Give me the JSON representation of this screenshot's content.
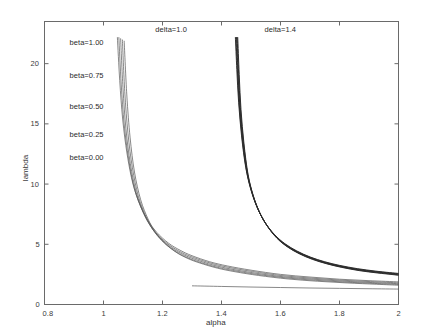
{
  "chart_data": {
    "type": "line",
    "title": "",
    "xlabel": "alpha",
    "ylabel": "lambda",
    "xlim": [
      0.8,
      2.0
    ],
    "ylim": [
      0,
      23.5
    ],
    "xticks": [
      "0.8",
      "1",
      "1.2",
      "1.4",
      "1.6",
      "1.8",
      "2"
    ],
    "xtick_values": [
      0.8,
      1.0,
      1.2,
      1.4,
      1.6,
      1.8,
      2.0
    ],
    "yticks": [
      "0",
      "5",
      "10",
      "15",
      "20"
    ],
    "ytick_values": [
      0,
      5,
      10,
      15,
      20
    ],
    "grid": false,
    "legend_position": "inside-upper-left",
    "annotations": [
      {
        "text": "delta=1.0",
        "x": 1.23,
        "y": 22.8
      },
      {
        "text": "delta=1.4",
        "x": 1.6,
        "y": 22.8
      }
    ],
    "legend_entries": [
      {
        "label": "beta=1.00",
        "y": 21.7
      },
      {
        "label": "beta=0.75",
        "y": 19.0
      },
      {
        "label": "beta=0.50",
        "y": 16.4
      },
      {
        "label": "beta=0.25",
        "y": 14.1
      },
      {
        "label": "beta=0.00",
        "y": 12.2
      }
    ],
    "series": [
      {
        "name": "delta=1.0, beta=1.00",
        "delta": 1.0,
        "beta": 1.0,
        "color": "#555555",
        "x": [
          1.047,
          1.055,
          1.065,
          1.08,
          1.1,
          1.125,
          1.15,
          1.18,
          1.22,
          1.26,
          1.3,
          1.36,
          1.42,
          1.5,
          1.6,
          1.7,
          1.8,
          1.9,
          2.0
        ],
        "y": [
          22.2,
          18.6,
          15.4,
          12.5,
          10.0,
          8.2,
          7.0,
          6.0,
          5.1,
          4.5,
          4.05,
          3.55,
          3.2,
          2.85,
          2.5,
          2.28,
          2.1,
          1.98,
          1.88
        ]
      },
      {
        "name": "delta=1.0, beta=0.75",
        "delta": 1.0,
        "beta": 0.75,
        "color": "#555555",
        "x": [
          1.052,
          1.06,
          1.07,
          1.085,
          1.105,
          1.13,
          1.155,
          1.185,
          1.225,
          1.265,
          1.305,
          1.365,
          1.425,
          1.505,
          1.605,
          1.705,
          1.805,
          1.905,
          2.0
        ],
        "y": [
          22.2,
          18.3,
          15.0,
          12.1,
          9.6,
          7.9,
          6.7,
          5.75,
          4.9,
          4.32,
          3.9,
          3.42,
          3.08,
          2.74,
          2.4,
          2.19,
          2.02,
          1.9,
          1.8
        ]
      },
      {
        "name": "delta=1.0, beta=0.50",
        "delta": 1.0,
        "beta": 0.5,
        "color": "#555555",
        "x": [
          1.058,
          1.066,
          1.076,
          1.091,
          1.111,
          1.136,
          1.161,
          1.191,
          1.231,
          1.271,
          1.311,
          1.371,
          1.431,
          1.511,
          1.611,
          1.711,
          1.811,
          1.911,
          2.0
        ],
        "y": [
          22.1,
          18.0,
          14.6,
          11.7,
          9.3,
          7.6,
          6.45,
          5.52,
          4.7,
          4.14,
          3.74,
          3.28,
          2.95,
          2.62,
          2.3,
          2.1,
          1.94,
          1.82,
          1.73
        ]
      },
      {
        "name": "delta=1.0, beta=0.25",
        "delta": 1.0,
        "beta": 0.25,
        "color": "#555555",
        "x": [
          1.064,
          1.072,
          1.083,
          1.098,
          1.118,
          1.143,
          1.168,
          1.198,
          1.238,
          1.278,
          1.318,
          1.378,
          1.438,
          1.518,
          1.618,
          1.718,
          1.818,
          1.918,
          2.0
        ],
        "y": [
          22.0,
          17.7,
          14.2,
          11.35,
          9.0,
          7.35,
          6.2,
          5.3,
          4.5,
          3.96,
          3.58,
          3.14,
          2.83,
          2.51,
          2.21,
          2.01,
          1.86,
          1.75,
          1.66
        ]
      },
      {
        "name": "delta=1.0, beta=0.00",
        "delta": 1.0,
        "beta": 0.0,
        "color": "#555555",
        "x": [
          1.07,
          1.079,
          1.09,
          1.105,
          1.126,
          1.151,
          1.176,
          1.206,
          1.246,
          1.286,
          1.326,
          1.386,
          1.446,
          1.526,
          1.626,
          1.726,
          1.826,
          1.926,
          2.0
        ],
        "y": [
          21.9,
          17.4,
          13.9,
          11.0,
          8.7,
          7.1,
          6.0,
          5.12,
          4.34,
          3.82,
          3.45,
          3.02,
          2.72,
          2.41,
          2.12,
          1.93,
          1.79,
          1.68,
          1.6
        ]
      },
      {
        "name": "delta=1.4, beta=1.00",
        "delta": 1.4,
        "beta": 1.0,
        "color": "#2a2a2a",
        "x": [
          1.447,
          1.452,
          1.458,
          1.468,
          1.482,
          1.5,
          1.522,
          1.548,
          1.58,
          1.615,
          1.655,
          1.7,
          1.75,
          1.8,
          1.86,
          1.92,
          1.97,
          2.0
        ],
        "y": [
          22.2,
          19.5,
          16.8,
          14.0,
          11.4,
          9.5,
          8.0,
          6.8,
          5.8,
          5.05,
          4.45,
          3.95,
          3.55,
          3.25,
          2.98,
          2.78,
          2.65,
          2.58
        ]
      },
      {
        "name": "delta=1.4, beta=0.75",
        "delta": 1.4,
        "beta": 0.75,
        "color": "#2a2a2a",
        "x": [
          1.449,
          1.454,
          1.46,
          1.47,
          1.484,
          1.502,
          1.524,
          1.55,
          1.582,
          1.617,
          1.657,
          1.702,
          1.752,
          1.802,
          1.862,
          1.922,
          1.972,
          2.0
        ],
        "y": [
          22.2,
          19.4,
          16.65,
          13.85,
          11.25,
          9.38,
          7.9,
          6.72,
          5.72,
          4.98,
          4.39,
          3.9,
          3.5,
          3.2,
          2.93,
          2.74,
          2.61,
          2.54
        ]
      },
      {
        "name": "delta=1.4, beta=0.50",
        "delta": 1.4,
        "beta": 0.5,
        "color": "#2a2a2a",
        "x": [
          1.451,
          1.456,
          1.462,
          1.472,
          1.486,
          1.504,
          1.526,
          1.552,
          1.584,
          1.619,
          1.659,
          1.704,
          1.754,
          1.804,
          1.864,
          1.924,
          1.974,
          2.0
        ],
        "y": [
          22.2,
          19.3,
          16.5,
          13.7,
          11.1,
          9.26,
          7.8,
          6.64,
          5.64,
          4.91,
          4.33,
          3.85,
          3.45,
          3.16,
          2.89,
          2.7,
          2.57,
          2.5
        ]
      },
      {
        "name": "delta=1.4, beta=0.25",
        "delta": 1.4,
        "beta": 0.25,
        "color": "#2a2a2a",
        "x": [
          1.453,
          1.458,
          1.464,
          1.474,
          1.488,
          1.506,
          1.528,
          1.554,
          1.586,
          1.621,
          1.661,
          1.706,
          1.756,
          1.806,
          1.866,
          1.926,
          1.976,
          2.0
        ],
        "y": [
          22.2,
          19.2,
          16.35,
          13.55,
          10.95,
          9.14,
          7.7,
          6.56,
          5.57,
          4.85,
          4.27,
          3.8,
          3.41,
          3.12,
          2.85,
          2.66,
          2.53,
          2.46
        ]
      },
      {
        "name": "delta=1.4, beta=0.00",
        "delta": 1.4,
        "beta": 0.0,
        "color": "#2a2a2a",
        "x": [
          1.455,
          1.46,
          1.466,
          1.476,
          1.49,
          1.508,
          1.53,
          1.556,
          1.588,
          1.623,
          1.663,
          1.708,
          1.758,
          1.808,
          1.868,
          1.928,
          1.978,
          2.0
        ],
        "y": [
          22.2,
          19.1,
          16.2,
          13.4,
          10.8,
          9.02,
          7.6,
          6.48,
          5.5,
          4.79,
          4.22,
          3.75,
          3.37,
          3.08,
          2.81,
          2.62,
          2.49,
          2.42
        ]
      },
      {
        "name": "lower branch delta=1.0 beta=1.00",
        "delta": 1.0,
        "beta": 1.0,
        "branch": "lower",
        "color": "#555555",
        "x": [
          1.3,
          1.4,
          1.5,
          1.6,
          1.7,
          1.8,
          1.9,
          2.0
        ],
        "y": [
          1.55,
          1.5,
          1.45,
          1.41,
          1.37,
          1.34,
          1.31,
          1.28
        ]
      }
    ]
  },
  "axis": {
    "xlabel": "alpha",
    "ylabel": "lambda"
  }
}
